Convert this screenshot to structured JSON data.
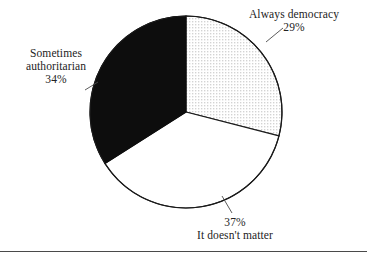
{
  "figure": {
    "type": "pie-chart-figure",
    "background_color": "#ffffff",
    "rule_color": "#4a4a4a"
  },
  "chart_data": {
    "type": "pie",
    "title": "",
    "categories": [
      "Always democracy",
      "It doesn't matter",
      "Sometimes authoritarian"
    ],
    "values": [
      29,
      37,
      34
    ],
    "value_suffix": "%",
    "labels": [
      "29%",
      "37%",
      "34%"
    ],
    "slice_fills": [
      "dotted",
      "white",
      "black"
    ],
    "slice_colors": [
      "#f4f4f4",
      "#ffffff",
      "#0d0d0d"
    ],
    "outline_color": "#1a1a1a",
    "start_angle_deg": 0,
    "direction": "clockwise",
    "legend": "none",
    "grid": false,
    "annotations": [
      {
        "text": "Always democracy",
        "value": "29%",
        "position": "top-right",
        "leader_line": true
      },
      {
        "text": "It doesn't matter",
        "value": "37%",
        "position": "bottom",
        "leader_line": true
      },
      {
        "text": "Sometimes authoritarian",
        "value": "34%",
        "position": "left",
        "leader_line": true
      }
    ]
  },
  "labels": {
    "always_democracy": {
      "name": "Always democracy",
      "percent": "29%"
    },
    "sometimes_authoritarian": {
      "name_line1": "Sometimes",
      "name_line2": "authoritarian",
      "percent": "34%"
    },
    "it_doesnt_matter": {
      "name": "It doesn't matter",
      "percent": "37%"
    }
  }
}
